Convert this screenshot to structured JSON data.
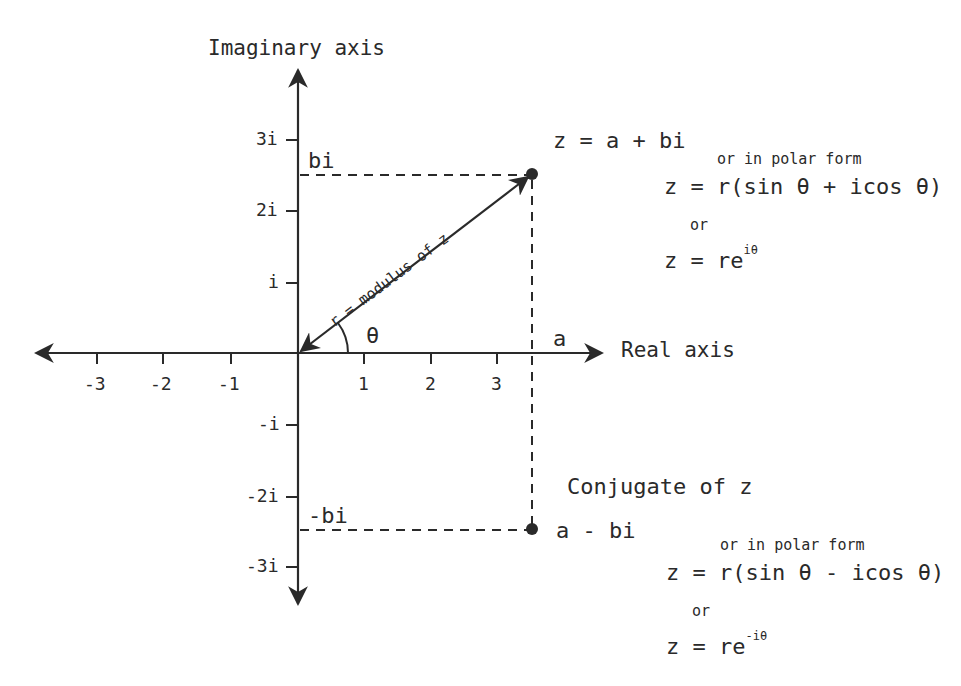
{
  "axes": {
    "imaginary_title": "Imaginary axis",
    "real_title": "Real axis",
    "x_ticks": [
      "-3",
      "-2",
      "-1",
      "1",
      "2",
      "3"
    ],
    "y_ticks": [
      "3i",
      "2i",
      "i",
      "-i",
      "-2i",
      "-3i"
    ]
  },
  "point_z": {
    "label": "z = a + bi",
    "projection_x_label": "a",
    "projection_y_label": "bi",
    "modulus_label": "r = modulus of z",
    "angle_label": "θ",
    "polar_intro": "or in polar form",
    "polar_form": "z = r(sin θ + icos θ)",
    "or_label": "or",
    "exp_form_base": "z = re",
    "exp_form_sup": "iθ"
  },
  "conjugate": {
    "title": "Conjugate of z",
    "label": "a - bi",
    "projection_y_label": "-bi",
    "polar_intro": "or in polar form",
    "polar_form": "z = r(sin θ - icos θ)",
    "or_label": "or",
    "exp_form_base": "z = re",
    "exp_form_sup": "-iθ"
  },
  "colors": {
    "ink": "#2a2a2a",
    "background": "#ffffff"
  }
}
